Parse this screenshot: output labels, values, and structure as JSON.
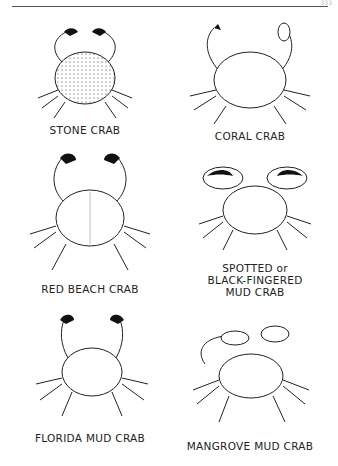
{
  "page": {
    "page_number": "333",
    "crabs": [
      {
        "name": "STONE CRAB"
      },
      {
        "name": "CORAL CRAB"
      },
      {
        "name": "RED BEACH CRAB"
      },
      {
        "name": "SPOTTED or\nBLACK-FINGERED\nMUD CRAB"
      },
      {
        "name": "FLORIDA MUD CRAB"
      },
      {
        "name": "MANGROVE MUD CRAB"
      }
    ]
  }
}
